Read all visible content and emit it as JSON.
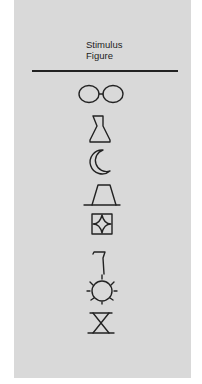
{
  "header": {
    "line1": "Stimulus",
    "line2": "Figure"
  },
  "figures": [
    {
      "name": "eyeglasses-icon"
    },
    {
      "name": "bottle-icon"
    },
    {
      "name": "crescent-moon-icon"
    },
    {
      "name": "trapezoid-hat-icon"
    },
    {
      "name": "diamond-in-square-icon"
    },
    {
      "name": "seven-glyph-icon"
    },
    {
      "name": "sun-circle-icon"
    },
    {
      "name": "hourglass-icon"
    }
  ],
  "colors": {
    "panel": "#d9d9d9",
    "ink": "#222222",
    "background": "#ffffff"
  }
}
